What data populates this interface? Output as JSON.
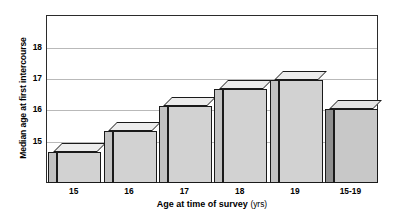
{
  "chart_data": {
    "type": "bar",
    "title": "",
    "xlabel": "Age at time of survey",
    "xlabel_unit": "(yrs)",
    "ylabel": "Median age at first intercourse",
    "categories": [
      "15",
      "16",
      "17",
      "18",
      "19",
      "15-19"
    ],
    "values": [
      14.65,
      15.3,
      16.1,
      16.65,
      16.95,
      16.0
    ],
    "ytick_labels": [
      "15",
      "16",
      "17",
      "18"
    ],
    "ytick_values": [
      15,
      16,
      17,
      18
    ],
    "ylim": [
      13.66,
      19.0
    ],
    "grid": true,
    "legend": "none",
    "style": "3d-bar",
    "series": [
      {
        "name": "Median age at first intercourse",
        "values": [
          14.65,
          15.3,
          16.1,
          16.65,
          16.95,
          16.0
        ]
      }
    ],
    "bar_styles": [
      "light",
      "light",
      "light",
      "light",
      "light",
      "dark"
    ],
    "colors": {
      "bar_face": "#d2d2d2",
      "bar_side": "#c2c2c2",
      "bar_top": "#ececec",
      "bar_face_dark": "#c8c8c8",
      "bar_side_dark": "#8f8f8f",
      "outline": "#1a1a1a",
      "gridline": "#b9b9b9",
      "frame": "#2b2b2b",
      "background": "#ffffff"
    }
  }
}
